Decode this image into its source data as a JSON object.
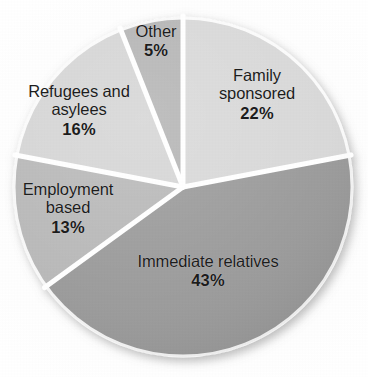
{
  "chart_data": {
    "type": "pie",
    "title": "",
    "subtitle": "",
    "xlabel": "",
    "ylabel": "",
    "legend_position": "none",
    "grid": false,
    "value_unit": "percent",
    "label_format": "{name} {value}%",
    "start_angle_deg": 0,
    "direction": "clockwise",
    "center": {
      "x": 183,
      "y": 187
    },
    "radius": 170,
    "separator_color": "#ffffff",
    "categories": [
      "Family sponsored",
      "Immediate relatives",
      "Employment based",
      "Refugees and asylees",
      "Other"
    ],
    "values": [
      22,
      43,
      13,
      16,
      5
    ],
    "colors": [
      "#d8d8d8",
      "#9a9a9a",
      "#b8b8b8",
      "#d5d5d5",
      "#b4b4b4"
    ],
    "slices": [
      {
        "name": "Family sponsored",
        "value": 22,
        "value_label": "22%",
        "color": "#d8d8d8",
        "start_deg": 0,
        "end_deg": 79.2
      },
      {
        "name": "Immediate relatives",
        "value": 43,
        "value_label": "43%",
        "color": "#9a9a9a",
        "start_deg": 79.2,
        "end_deg": 234.0
      },
      {
        "name": "Employment based",
        "value": 13,
        "value_label": "13%",
        "color": "#b8b8b8",
        "start_deg": 234.0,
        "end_deg": 280.8
      },
      {
        "name": "Refugees and asylees",
        "value": 16,
        "value_label": "16%",
        "color": "#d5d5d5",
        "start_deg": 280.8,
        "end_deg": 338.4
      },
      {
        "name": "Other",
        "value": 5,
        "value_label": "5%",
        "color": "#b4b4b4",
        "start_deg": 338.4,
        "end_deg": 360.0
      }
    ]
  },
  "labels": {
    "other": {
      "name": "Other",
      "percent": "5%"
    },
    "family": {
      "line1": "Family",
      "line2": "sponsored",
      "percent": "22%"
    },
    "refugees": {
      "line1": "Refugees and",
      "line2": "asylees",
      "percent": "16%"
    },
    "employment": {
      "line1": "Employment",
      "line2": "based",
      "percent": "13%"
    },
    "immediate": {
      "name": "Immediate relatives",
      "percent": "43%"
    }
  }
}
